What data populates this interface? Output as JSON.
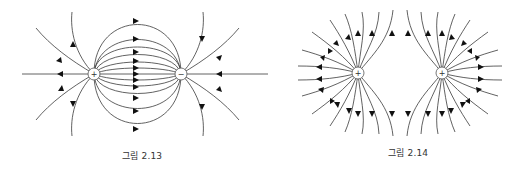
{
  "figures": [
    {
      "id": "fig-2-13",
      "caption": "그림 2.13",
      "description": "Electric field lines between a positive and a negative charge",
      "charges": [
        {
          "sign": "+",
          "label": "+",
          "x": 94,
          "y": 74
        },
        {
          "sign": "-",
          "label": "−",
          "x": 181,
          "y": 74
        }
      ]
    },
    {
      "id": "fig-2-14",
      "caption": "그림 2.14",
      "description": "Electric field lines of two positive charges",
      "charges": [
        {
          "sign": "+",
          "label": "+",
          "x": 358,
          "y": 73
        },
        {
          "sign": "+",
          "label": "+",
          "x": 442,
          "y": 73
        }
      ]
    }
  ],
  "colors": {
    "line": "#3a3a3a",
    "arrow": "#111111",
    "charge_fill": "#ffffff"
  }
}
